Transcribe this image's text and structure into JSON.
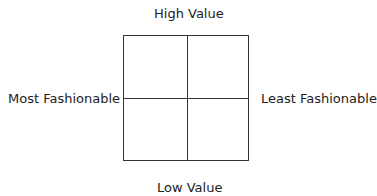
{
  "diagram": {
    "type": "2x2 matrix",
    "labels": {
      "top": "High Value",
      "bottom": "Low Value",
      "left": "Most Fashionable",
      "right": "Least Fashionable"
    },
    "colors": {
      "line": "#333333",
      "text": "#222222",
      "background": "#ffffff"
    }
  }
}
